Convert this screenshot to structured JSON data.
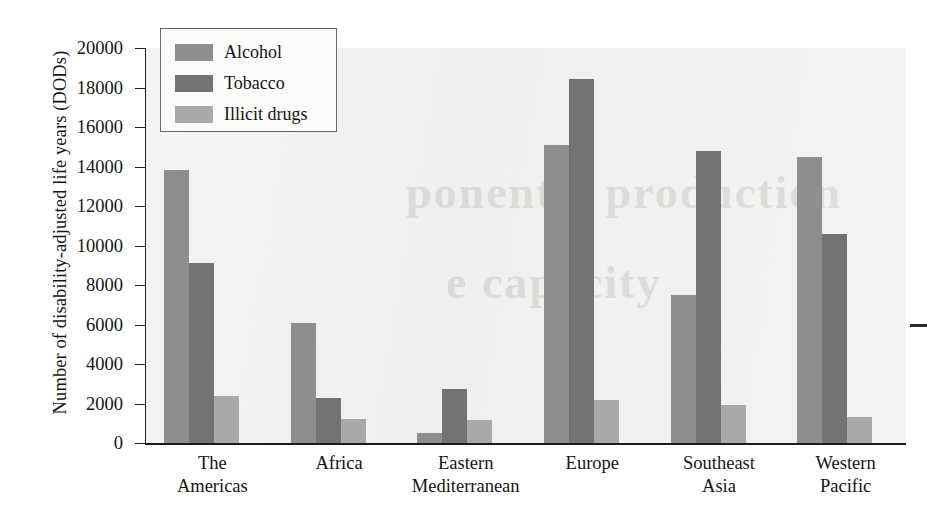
{
  "chart_data": {
    "type": "bar",
    "title": "",
    "xlabel": "",
    "ylabel": "Number of disability-adjusted life years (DODs)",
    "ylim": [
      0,
      20000
    ],
    "ytick_step": 2000,
    "yticks": [
      "0",
      "2000",
      "4000",
      "6000",
      "8000",
      "10000",
      "12000",
      "14000",
      "16000",
      "18000",
      "20000"
    ],
    "grid": false,
    "legend_position": "top-left",
    "categories": [
      "The Americas",
      "Africa",
      "Eastern Mediterranean",
      "Europe",
      "Southeast Asia",
      "Western Pacific"
    ],
    "category_lines": [
      [
        "The",
        "Americas"
      ],
      [
        "Africa"
      ],
      [
        "Eastern",
        "Mediterranean"
      ],
      [
        "Europe"
      ],
      [
        "Southeast",
        "Asia"
      ],
      [
        "Western",
        "Pacific"
      ]
    ],
    "series": [
      {
        "name": "Alcohol",
        "color": "#8e8e8e",
        "values": [
          13800,
          6100,
          500,
          15100,
          7500,
          14500
        ]
      },
      {
        "name": "Tobacco",
        "color": "#737373",
        "values": [
          9100,
          2300,
          2750,
          18450,
          14800,
          10600
        ]
      },
      {
        "name": "Illicit drugs",
        "color": "#a9a9a9",
        "values": [
          2400,
          1200,
          1150,
          2200,
          1950,
          1300
        ]
      }
    ]
  },
  "legend": {
    "items": [
      {
        "label": "Alcohol"
      },
      {
        "label": "Tobacco"
      },
      {
        "label": "Illicit drugs"
      }
    ]
  },
  "axes": {
    "y_title": "Number of disability-adjusted life years (DODs)"
  },
  "ghost_text": {
    "line1": "ponent a production",
    "line2": "e capacity"
  }
}
